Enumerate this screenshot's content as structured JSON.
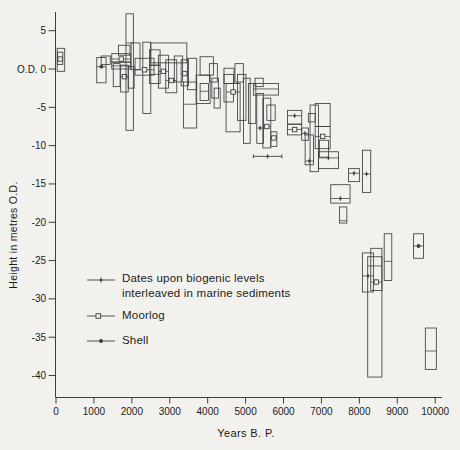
{
  "figure": {
    "background": "#f2f1ed",
    "stroke_color": "#3e3e3e",
    "text_color": "#1c1c1c"
  },
  "chart_data": {
    "type": "scatter",
    "subtype": "age-altitude error boxes (sea-level index points)",
    "title": "",
    "xlabel": "Years B. P.",
    "ylabel": "Height in metres O.D.",
    "xlim": [
      0,
      10200
    ],
    "ylim": [
      -43,
      7.5
    ],
    "grid": false,
    "x_ticks": [
      0,
      1000,
      2000,
      3000,
      4000,
      5000,
      6000,
      7000,
      8000,
      9000,
      10000
    ],
    "y_ticks": [
      {
        "v": 5,
        "label": "5"
      },
      {
        "v": 0,
        "label": "O.D. 0"
      },
      {
        "v": -5,
        "label": "-5"
      },
      {
        "v": -10,
        "label": "-10"
      },
      {
        "v": -15,
        "label": "-15"
      },
      {
        "v": -20,
        "label": "-20"
      },
      {
        "v": -25,
        "label": "-25"
      },
      {
        "v": -30,
        "label": "-30"
      },
      {
        "v": -35,
        "label": "-35"
      },
      {
        "v": -40,
        "label": "-40"
      }
    ],
    "legend": {
      "position": "inside-lower-left",
      "items": [
        {
          "marker": "biogenic",
          "lines": [
            "Dates upon biogenic levels",
            "interleaved in marine sediments"
          ]
        },
        {
          "marker": "moorlog",
          "lines": [
            "Moorlog",
            ""
          ]
        },
        {
          "marker": "shell",
          "lines": [
            "Shell",
            ""
          ]
        }
      ]
    },
    "boxes": [
      {
        "x1": 30,
        "x2": 230,
        "top": 2.7,
        "bot": -0.3
      },
      {
        "x1": 40,
        "x2": 180,
        "top": 2.2,
        "bot": 0.6,
        "marker": "moorlog",
        "level": 1.3
      },
      {
        "x1": 1075,
        "x2": 1320,
        "top": 1.5,
        "bot": -1.8,
        "marker": "shell",
        "level": 0.3
      },
      {
        "x1": 1190,
        "x2": 1430,
        "top": 1.7,
        "bot": 0.6
      },
      {
        "x1": 1470,
        "x2": 1970,
        "top": 2.0,
        "bot": 0.9,
        "marker": "moorlog",
        "level": 1.3
      },
      {
        "x1": 1470,
        "x2": 1970,
        "top": 0.9,
        "bot": 0.0,
        "level": 0.4
      },
      {
        "x1": 1510,
        "x2": 1690,
        "top": 0.7,
        "bot": -2.3
      },
      {
        "x1": 1705,
        "x2": 1905,
        "top": 0.5,
        "bot": -3.0,
        "marker": "moorlog",
        "level": -1.0
      },
      {
        "x1": 1905,
        "x2": 2060,
        "top": 0.3,
        "bot": -2.5
      },
      {
        "x1": 1645,
        "x2": 1950,
        "top": 3.1,
        "bot": 1.8
      },
      {
        "x1": 1980,
        "x2": 2215,
        "top": 3.4,
        "bot": -0.1
      },
      {
        "x1": 1845,
        "x2": 2040,
        "top": 7.2,
        "bot": -8.0,
        "level": 3.4
      },
      {
        "x1": 2290,
        "x2": 2500,
        "top": 3.5,
        "bot": -5.8
      },
      {
        "x1": 2085,
        "x2": 2585,
        "top": 1.4,
        "bot": -0.8,
        "marker": "moorlog",
        "level": -0.1
      },
      {
        "x1": 2465,
        "x2": 2745,
        "top": 2.5,
        "bot": 0.5
      },
      {
        "x1": 2465,
        "x2": 2745,
        "top": 0.5,
        "bot": -1.9,
        "level": -0.7
      },
      {
        "x1": 2700,
        "x2": 2965,
        "top": 1.8,
        "bot": -2.5,
        "marker": "moorlog",
        "level": -0.3
      },
      {
        "x1": 2895,
        "x2": 3185,
        "top": 1.2,
        "bot": -3.1,
        "marker": "moorlog",
        "level": -1.5
      },
      {
        "x1": 3120,
        "x2": 3340,
        "top": 1.7,
        "bot": -1.7
      },
      {
        "x1": 3300,
        "x2": 3495,
        "top": 1.2,
        "bot": -2.2,
        "marker": "moorlog",
        "level": -0.6
      },
      {
        "x1": 3465,
        "x2": 3710,
        "top": 1.4,
        "bot": -2.7
      },
      {
        "x1": 2500,
        "x2": 3450,
        "top": 3.4,
        "bot": 0.8
      },
      {
        "x1": 3360,
        "x2": 3710,
        "top": -1.7,
        "bot": -7.7,
        "level": -4.6
      },
      {
        "x1": 3695,
        "x2": 4065,
        "top": -0.8,
        "bot": -4.5
      },
      {
        "x1": 3800,
        "x2": 4150,
        "top": 1.6,
        "bot": -0.8
      },
      {
        "x1": 4045,
        "x2": 4255,
        "top": 0.7,
        "bot": -1.7
      },
      {
        "x1": 4110,
        "x2": 4285,
        "top": -1.2,
        "bot": -3.8
      },
      {
        "x1": 4170,
        "x2": 4330,
        "top": -2.5,
        "bot": -5.1
      },
      {
        "x1": 3800,
        "x2": 4020,
        "top": -1.9,
        "bot": -4.1,
        "level": -2.9
      },
      {
        "x1": 4430,
        "x2": 4695,
        "top": 0.1,
        "bot": -1.9
      },
      {
        "x1": 4430,
        "x2": 4680,
        "top": -0.7,
        "bot": -4.3
      },
      {
        "x1": 4485,
        "x2": 4855,
        "top": -1.9,
        "bot": -8.2,
        "marker": "moorlog",
        "level": -3.0
      },
      {
        "x1": 4720,
        "x2": 4940,
        "top": 0.7,
        "bot": -1.7
      },
      {
        "x1": 4785,
        "x2": 5010,
        "top": -0.7,
        "bot": -6.7
      },
      {
        "x1": 4945,
        "x2": 5120,
        "top": -1.2,
        "bot": -9.7
      },
      {
        "x1": 5075,
        "x2": 5270,
        "top": -1.9,
        "bot": -7.1
      },
      {
        "x1": 5250,
        "x2": 5465,
        "top": -1.2,
        "bot": -2.3
      },
      {
        "x1": 5205,
        "x2": 5865,
        "top": -1.9,
        "bot": -3.4,
        "level": -2.6
      },
      {
        "x1": 5295,
        "x2": 5470,
        "top": -3.2,
        "bot": -9.7,
        "marker": "biogenic",
        "level": -7.7
      },
      {
        "x1": 5455,
        "x2": 5665,
        "top": -3.8,
        "bot": -10.3,
        "marker": "moorlog",
        "level": -7.5
      },
      {
        "x1": 5665,
        "x2": 5825,
        "top": -8.2,
        "bot": -10.1,
        "marker": "moorlog",
        "level": -9.0
      },
      {
        "x1": 5560,
        "x2": 5780,
        "top": -4.7,
        "bot": -6.7
      },
      {
        "x1": 5205,
        "x2": 5955,
        "top": -11.4,
        "bot": -11.4,
        "marker": "biogenic",
        "level": -11.4
      },
      {
        "x1": 6105,
        "x2": 6480,
        "top": -5.4,
        "bot": -7.2,
        "marker": "biogenic",
        "level": -6.1
      },
      {
        "x1": 6105,
        "x2": 6480,
        "top": -7.2,
        "bot": -8.6,
        "marker": "moorlog",
        "level": -7.9
      },
      {
        "x1": 6655,
        "x2": 6835,
        "top": -5.8,
        "bot": -6.9
      },
      {
        "x1": 6480,
        "x2": 6655,
        "top": -7.7,
        "bot": -9.3,
        "marker": "biogenic",
        "level": -8.4
      },
      {
        "x1": 6570,
        "x2": 6790,
        "top": -8.6,
        "bot": -12.5,
        "marker": "biogenic",
        "level": -12.0
      },
      {
        "x1": 6700,
        "x2": 6920,
        "top": -4.7,
        "bot": -13.4
      },
      {
        "x1": 6835,
        "x2": 7230,
        "top": -4.5,
        "bot": -7.5
      },
      {
        "x1": 6835,
        "x2": 7230,
        "top": -7.5,
        "bot": -10.4,
        "marker": "moorlog",
        "level": -8.8
      },
      {
        "x1": 6945,
        "x2": 7185,
        "top": -9.3,
        "bot": -11.5
      },
      {
        "x1": 6920,
        "x2": 7450,
        "top": -10.8,
        "bot": -13.0,
        "marker": "biogenic",
        "level": -11.6
      },
      {
        "x1": 7245,
        "x2": 7755,
        "top": -15.1,
        "bot": -17.5,
        "marker": "biogenic",
        "level": -16.9
      },
      {
        "x1": 7475,
        "x2": 7670,
        "top": -18.0,
        "bot": -20.1,
        "level": -19.8
      },
      {
        "x1": 7715,
        "x2": 8000,
        "top": -13.0,
        "bot": -14.7,
        "marker": "biogenic",
        "level": -13.6
      },
      {
        "x1": 8080,
        "x2": 8300,
        "top": -10.6,
        "bot": -16.1,
        "marker": "biogenic",
        "level": -13.7
      },
      {
        "x1": 8080,
        "x2": 8370,
        "top": -24.0,
        "bot": -29.1,
        "marker": "biogenic",
        "level": -27.0
      },
      {
        "x1": 8300,
        "x2": 8595,
        "top": -23.4,
        "bot": -28.9,
        "marker": "moorlog",
        "level": -27.8
      },
      {
        "x1": 8220,
        "x2": 8595,
        "top": -24.5,
        "bot": -40.2,
        "level": -25.7
      },
      {
        "x1": 8655,
        "x2": 8855,
        "top": -21.5,
        "bot": -27.6,
        "level": -25.1
      },
      {
        "x1": 9430,
        "x2": 9690,
        "top": -21.5,
        "bot": -24.7,
        "marker": "shell",
        "level": -23.1
      },
      {
        "x1": 9740,
        "x2": 10030,
        "top": -33.8,
        "bot": -39.2,
        "level": -36.8
      }
    ]
  }
}
